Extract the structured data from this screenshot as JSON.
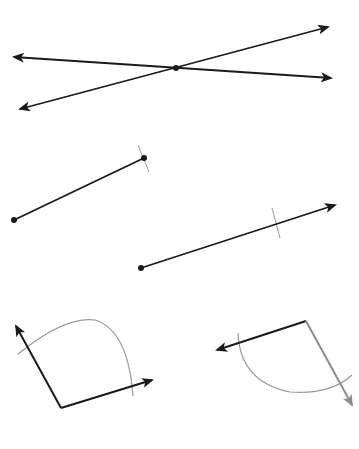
{
  "diagram": {
    "colors": {
      "background": "#ffffff",
      "stroke": "#1a1a1a",
      "construction": "#999999",
      "gray_ray": "#8c8c8c"
    },
    "figures": [
      {
        "id": "intersecting-lines",
        "type": "intersecting-lines",
        "intersection_point": [
          176,
          68
        ],
        "lines": [
          {
            "from": [
              14,
              57
            ],
            "to": [
              331,
              78
            ],
            "arrows": "both"
          },
          {
            "from": [
              20,
              109
            ],
            "to": [
              328,
              27
            ],
            "arrows": "both"
          }
        ]
      },
      {
        "id": "line-segment",
        "type": "segment",
        "from": [
          14,
          220
        ],
        "to": [
          144,
          158
        ],
        "endpoints": "dots",
        "construction_tick": {
          "at": [
            144,
            158
          ],
          "from": [
            137,
            145
          ],
          "to": [
            149,
            172
          ]
        }
      },
      {
        "id": "ray",
        "type": "ray",
        "from": [
          141,
          268
        ],
        "to": [
          335,
          205
        ],
        "endpoint": "dot",
        "construction_tick": {
          "from": [
            272,
            208
          ],
          "to": [
            280,
            238
          ]
        }
      },
      {
        "id": "angle-1",
        "type": "angle",
        "vertex": [
          61,
          408
        ],
        "rays": [
          {
            "to": [
              16,
              326
            ],
            "color": "stroke"
          },
          {
            "to": [
              152,
              380
            ],
            "color": "stroke"
          }
        ],
        "arc": {
          "from": [
            18,
            354
          ],
          "control": [
            95,
            295
          ],
          "to": [
            133,
            396
          ]
        }
      },
      {
        "id": "angle-2",
        "type": "angle",
        "vertex": [
          306,
          321
        ],
        "rays": [
          {
            "to": [
              217,
              350
            ],
            "color": "stroke"
          },
          {
            "to": [
              352,
              405
            ],
            "color": "gray_ray"
          }
        ],
        "arc": {
          "from": [
            238,
            333
          ],
          "control": [
            265,
            425
          ],
          "to": [
            352,
            375
          ]
        }
      }
    ]
  }
}
